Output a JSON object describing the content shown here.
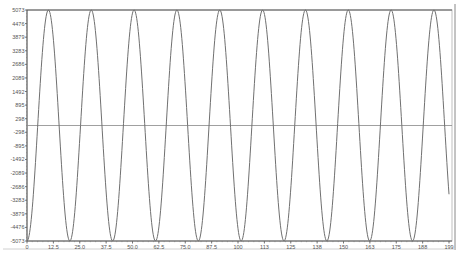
{
  "chart_data": {
    "type": "line",
    "title": "",
    "xlabel": "",
    "ylabel": "",
    "xlim": [
      0,
      199
    ],
    "ylim": [
      -5073,
      5073
    ],
    "grid": false,
    "legend": null,
    "x_ticks": [
      "0",
      "12.5",
      "25.0",
      "37.5",
      "50.0",
      "62.5",
      "75.0",
      "87.5",
      "100",
      "113",
      "125",
      "138",
      "150",
      "163",
      "175",
      "188",
      "199"
    ],
    "y_ticks": [
      "5073",
      "4476",
      "3879",
      "3283",
      "2686",
      "2089",
      "1492",
      "895",
      "298",
      "-298",
      "-895",
      "-1492",
      "-2089",
      "-2686",
      "-3283",
      "-3879",
      "-4476",
      "-5073"
    ],
    "reference_line": {
      "y": 0,
      "color": "#888888"
    },
    "series": [
      {
        "name": "signal",
        "color": "#707070",
        "description": "Sinusoid, amplitude ~5073, period ~20.2 samples, trough at x=0, ~10 full cycles over 0-199",
        "amplitude": 5073,
        "period": 20.2,
        "phase_trough_at": 0,
        "x": [
          0,
          5,
          10,
          15,
          20,
          25,
          30,
          35,
          40,
          45,
          50,
          55,
          60,
          65,
          70,
          75,
          80,
          85,
          90,
          95,
          100,
          105,
          110,
          115,
          120,
          125,
          130,
          135,
          140,
          145,
          150,
          155,
          160,
          165,
          170,
          175,
          180,
          185,
          190,
          195,
          199
        ],
        "values": [
          -5073,
          -62,
          5063,
          185,
          -5035,
          -308,
          4988,
          430,
          -4923,
          -549,
          4840,
          666,
          -4740,
          -779,
          4623,
          888,
          -4490,
          -993,
          4342,
          1093,
          -4179,
          -1187,
          4003,
          1275,
          -3814,
          -1357,
          3614,
          1432,
          -3403,
          -1500,
          3183,
          1560,
          -2955,
          -1613,
          2720,
          1658,
          -2479,
          -1695,
          2233,
          1725,
          -3880
        ]
      }
    ]
  }
}
